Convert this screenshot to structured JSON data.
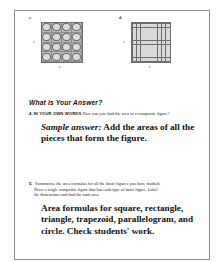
{
  "page": {
    "figures": [
      {
        "letter": "c.",
        "kind": "circles-grid",
        "rows": 4,
        "columns": 4,
        "left_label": "s",
        "bottom_label": "s"
      },
      {
        "letter": "d.",
        "kind": "squares-grid",
        "rows": 9,
        "columns": 9,
        "left_label": "s",
        "bottom_label": "s"
      }
    ],
    "section_heading": "What Is Your Answer?",
    "questions": [
      {
        "number": "4.",
        "caps_lead": "IN YOUR OWN WORDS",
        "prompt": "How can you find the area of a composite figure?",
        "answer_prefix": "Sample answer:",
        "answer_text": "Add the areas of all the pieces that form the figure."
      },
      {
        "number": "5.",
        "prompt_line_1": "Summarize the area formulas for all the basic figures you have studied.",
        "prompt_line_2": "Draw a single composite figure that has each type of basic figure. Label",
        "prompt_line_3": "the dimensions and find the total area.",
        "answer_text": "Area formulas for square, rectangle, triangle, trapezoid, parallelogram, and circle. Check students' work."
      }
    ]
  }
}
